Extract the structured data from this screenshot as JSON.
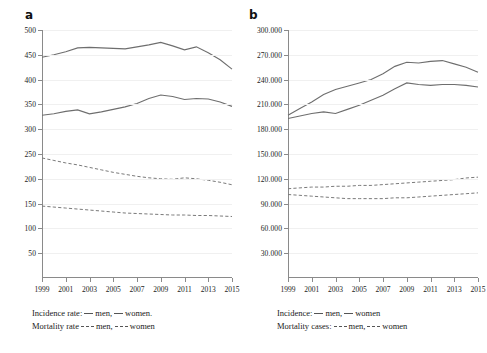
{
  "figure": {
    "panels": [
      {
        "label": "a",
        "legend_line1_prefix": "Incidence rate:",
        "legend_line1_men": "men,",
        "legend_line1_women": "women.",
        "legend_line2_prefix": "Mortality rate",
        "legend_line2_men": "men,",
        "legend_line2_women": "women"
      },
      {
        "label": "b",
        "legend_line1_prefix": "Incidence:",
        "legend_line1_men": "men,",
        "legend_line1_women": "women",
        "legend_line2_prefix": "Mortality cases:",
        "legend_line2_men": "men,",
        "legend_line2_women": "women"
      }
    ]
  },
  "chart_data": [
    {
      "type": "line",
      "panel": "a",
      "title": "",
      "xlabel": "",
      "ylabel": "",
      "grid": true,
      "legend_position": "below",
      "x": [
        1999,
        2000,
        2001,
        2002,
        2003,
        2004,
        2005,
        2006,
        2007,
        2008,
        2009,
        2010,
        2011,
        2012,
        2013,
        2014,
        2015
      ],
      "xtick_labels": [
        "1999",
        "2001",
        "2003",
        "2005",
        "2007",
        "2009",
        "2011",
        "2013",
        "2015"
      ],
      "xtick_values": [
        1999,
        2001,
        2003,
        2005,
        2007,
        2009,
        2011,
        2013,
        2015
      ],
      "xlim": [
        1999,
        2015
      ],
      "ylim": [
        0,
        500
      ],
      "ytick_values": [
        50,
        100,
        150,
        200,
        250,
        300,
        350,
        400,
        450,
        500
      ],
      "ytick_labels": [
        "50",
        "100",
        "150",
        "200",
        "250",
        "300",
        "350",
        "400",
        "450",
        "500"
      ],
      "series": [
        {
          "name": "Incidence rate men",
          "style": "solid",
          "values": [
            445,
            450,
            456,
            464,
            465,
            464,
            463,
            462,
            466,
            470,
            475,
            468,
            460,
            466,
            454,
            440,
            421
          ]
        },
        {
          "name": "Incidence rate women",
          "style": "solid",
          "values": [
            328,
            331,
            336,
            339,
            331,
            335,
            340,
            345,
            352,
            362,
            369,
            366,
            360,
            362,
            361,
            355,
            346
          ]
        },
        {
          "name": "Mortality rate men",
          "style": "dashed",
          "values": [
            242,
            237,
            232,
            228,
            223,
            218,
            213,
            209,
            205,
            202,
            200,
            199,
            202,
            200,
            197,
            193,
            188
          ]
        },
        {
          "name": "Mortality rate women",
          "style": "dashed",
          "values": [
            145,
            143,
            141,
            139,
            137,
            135,
            133,
            131,
            130,
            129,
            128,
            127,
            127,
            126,
            126,
            125,
            124
          ]
        }
      ]
    },
    {
      "type": "line",
      "panel": "b",
      "title": "",
      "xlabel": "",
      "ylabel": "",
      "grid": true,
      "legend_position": "below",
      "x": [
        1999,
        2000,
        2001,
        2002,
        2003,
        2004,
        2005,
        2006,
        2007,
        2008,
        2009,
        2010,
        2011,
        2012,
        2013,
        2014,
        2015
      ],
      "xtick_labels": [
        "1999",
        "2001",
        "2003",
        "2005",
        "2007",
        "2009",
        "2011",
        "2013",
        "2015"
      ],
      "xtick_values": [
        1999,
        2001,
        2003,
        2005,
        2007,
        2009,
        2011,
        2013,
        2015
      ],
      "xlim": [
        1999,
        2015
      ],
      "ylim": [
        0,
        300000
      ],
      "ytick_values": [
        30000,
        60000,
        90000,
        120000,
        150000,
        180000,
        210000,
        240000,
        270000,
        300000
      ],
      "ytick_labels": [
        "30.000",
        "60.000",
        "90.000",
        "120.000",
        "150.000",
        "180.000",
        "210.000",
        "240.000",
        "270.000",
        "300.000"
      ],
      "series": [
        {
          "name": "Incidence men",
          "style": "solid",
          "values": [
            197000,
            205000,
            213000,
            222000,
            228000,
            232000,
            236000,
            240000,
            247000,
            256000,
            261000,
            260000,
            262000,
            263000,
            259000,
            255000,
            249000
          ]
        },
        {
          "name": "Incidence women",
          "style": "solid",
          "values": [
            193000,
            196000,
            199000,
            201000,
            199000,
            204000,
            209000,
            215000,
            221000,
            229000,
            236000,
            234000,
            233000,
            234000,
            234000,
            233000,
            231000
          ]
        },
        {
          "name": "Mortality cases men",
          "style": "dashed",
          "values": [
            108000,
            109000,
            110000,
            110000,
            111000,
            111000,
            112000,
            112000,
            113000,
            114000,
            115000,
            116000,
            117000,
            118000,
            119000,
            121000,
            122000
          ]
        },
        {
          "name": "Mortality cases women",
          "style": "dashed",
          "values": [
            101000,
            100000,
            99000,
            98000,
            97000,
            96000,
            96000,
            96000,
            96000,
            97000,
            97000,
            98000,
            99000,
            100000,
            101000,
            102000,
            103000
          ]
        }
      ]
    }
  ]
}
